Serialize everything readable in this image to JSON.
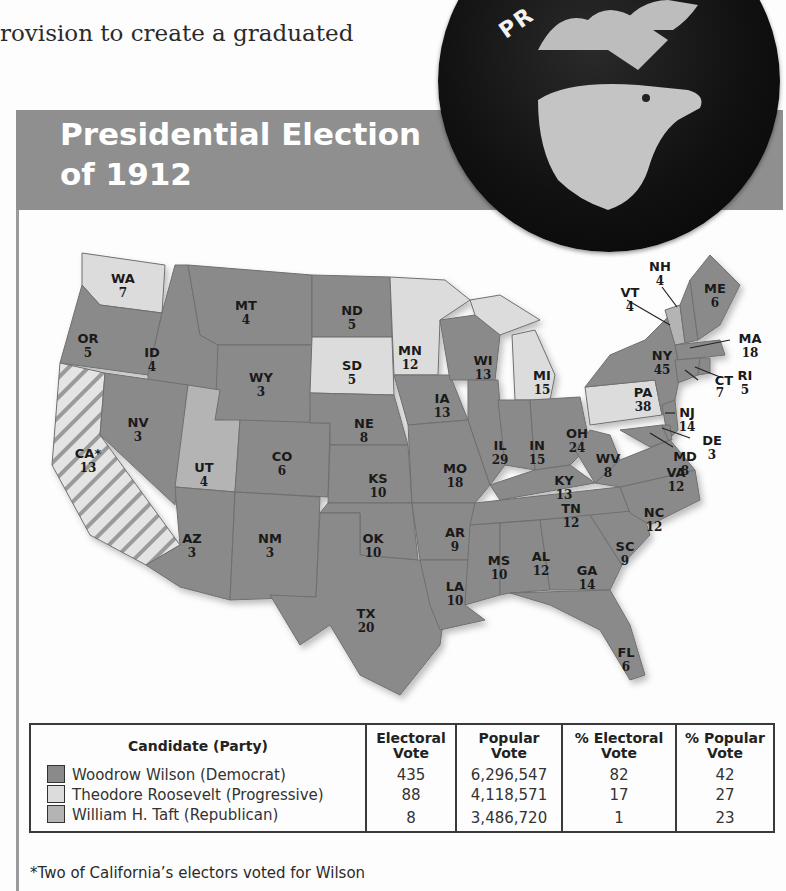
{
  "intro_text": "rovision to create a graduated",
  "header": {
    "title_line1": "Presidential Election",
    "title_line2": "of 1912",
    "band_color": "#8f8f8f"
  },
  "badge": {
    "visible_text": "PR",
    "icon": "bull-moose-icon"
  },
  "legend_colors": {
    "wilson": "#8a8a8a",
    "roosevelt": "#dcdcdc",
    "taft": "#b4b4b4"
  },
  "map": {
    "states": [
      {
        "abbr": "WA",
        "votes": "7",
        "winner": "roosevelt"
      },
      {
        "abbr": "OR",
        "votes": "5",
        "winner": "wilson"
      },
      {
        "abbr": "CA*",
        "votes": "13",
        "winner": "split"
      },
      {
        "abbr": "ID",
        "votes": "4",
        "winner": "wilson"
      },
      {
        "abbr": "NV",
        "votes": "3",
        "winner": "wilson"
      },
      {
        "abbr": "MT",
        "votes": "4",
        "winner": "wilson"
      },
      {
        "abbr": "WY",
        "votes": "3",
        "winner": "wilson"
      },
      {
        "abbr": "UT",
        "votes": "4",
        "winner": "taft"
      },
      {
        "abbr": "AZ",
        "votes": "3",
        "winner": "wilson"
      },
      {
        "abbr": "CO",
        "votes": "6",
        "winner": "wilson"
      },
      {
        "abbr": "NM",
        "votes": "3",
        "winner": "wilson"
      },
      {
        "abbr": "ND",
        "votes": "5",
        "winner": "wilson"
      },
      {
        "abbr": "SD",
        "votes": "5",
        "winner": "roosevelt"
      },
      {
        "abbr": "NE",
        "votes": "8",
        "winner": "wilson"
      },
      {
        "abbr": "KS",
        "votes": "10",
        "winner": "wilson"
      },
      {
        "abbr": "OK",
        "votes": "10",
        "winner": "wilson"
      },
      {
        "abbr": "TX",
        "votes": "20",
        "winner": "wilson"
      },
      {
        "abbr": "MN",
        "votes": "12",
        "winner": "roosevelt"
      },
      {
        "abbr": "IA",
        "votes": "13",
        "winner": "wilson"
      },
      {
        "abbr": "MO",
        "votes": "18",
        "winner": "wilson"
      },
      {
        "abbr": "AR",
        "votes": "9",
        "winner": "wilson"
      },
      {
        "abbr": "LA",
        "votes": "10",
        "winner": "wilson"
      },
      {
        "abbr": "WI",
        "votes": "13",
        "winner": "wilson"
      },
      {
        "abbr": "IL",
        "votes": "29",
        "winner": "wilson"
      },
      {
        "abbr": "MI",
        "votes": "15",
        "winner": "roosevelt"
      },
      {
        "abbr": "IN",
        "votes": "15",
        "winner": "wilson"
      },
      {
        "abbr": "OH",
        "votes": "24",
        "winner": "wilson"
      },
      {
        "abbr": "KY",
        "votes": "13",
        "winner": "wilson"
      },
      {
        "abbr": "TN",
        "votes": "12",
        "winner": "wilson"
      },
      {
        "abbr": "MS",
        "votes": "10",
        "winner": "wilson"
      },
      {
        "abbr": "AL",
        "votes": "12",
        "winner": "wilson"
      },
      {
        "abbr": "GA",
        "votes": "14",
        "winner": "wilson"
      },
      {
        "abbr": "FL",
        "votes": "6",
        "winner": "wilson"
      },
      {
        "abbr": "SC",
        "votes": "9",
        "winner": "wilson"
      },
      {
        "abbr": "NC",
        "votes": "12",
        "winner": "wilson"
      },
      {
        "abbr": "VA",
        "votes": "12",
        "winner": "wilson"
      },
      {
        "abbr": "WV",
        "votes": "8",
        "winner": "wilson"
      },
      {
        "abbr": "PA",
        "votes": "38",
        "winner": "roosevelt"
      },
      {
        "abbr": "NY",
        "votes": "45",
        "winner": "wilson"
      },
      {
        "abbr": "VT",
        "votes": "4",
        "winner": "taft"
      },
      {
        "abbr": "NH",
        "votes": "4",
        "winner": "wilson"
      },
      {
        "abbr": "ME",
        "votes": "6",
        "winner": "wilson"
      },
      {
        "abbr": "MA",
        "votes": "18",
        "winner": "wilson"
      },
      {
        "abbr": "RI",
        "votes": "5",
        "winner": "wilson"
      },
      {
        "abbr": "CT",
        "votes": "7",
        "winner": "wilson"
      },
      {
        "abbr": "NJ",
        "votes": "14",
        "winner": "wilson"
      },
      {
        "abbr": "DE",
        "votes": "3",
        "winner": "wilson"
      },
      {
        "abbr": "MD",
        "votes": "8",
        "winner": "wilson"
      }
    ]
  },
  "table": {
    "headers": {
      "candidate": "Candidate (Party)",
      "ev_1": "Electoral",
      "ev_2": "Vote",
      "pv_1": "Popular",
      "pv_2": "Vote",
      "pev_1": "% Electoral",
      "pev_2": "Vote",
      "ppv_1": "% Popular",
      "ppv_2": "Vote"
    },
    "rows": [
      {
        "candidate": "Woodrow Wilson (Democrat)",
        "electoral": "435",
        "popular": "6,296,547",
        "pct_electoral": "82",
        "pct_popular": "42"
      },
      {
        "candidate": "Theodore Roosevelt (Progressive)",
        "electoral": "88",
        "popular": "4,118,571",
        "pct_electoral": "17",
        "pct_popular": "27"
      },
      {
        "candidate": "William H. Taft (Republican)",
        "electoral": "8",
        "popular": "3,486,720",
        "pct_electoral": "1",
        "pct_popular": "23"
      }
    ]
  },
  "footnote": "*Two of California’s electors voted for Wilson"
}
